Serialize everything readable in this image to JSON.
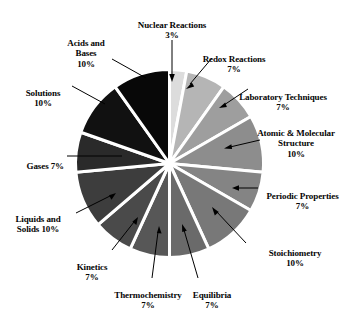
{
  "chart_data": {
    "type": "pie",
    "title": "",
    "subtitle": "",
    "xlabel": "",
    "ylabel": "",
    "legend_position": "none",
    "grid": false,
    "units": "percent",
    "total": 100,
    "start_angle_deg": 0,
    "direction": "clockwise",
    "categories": [
      "Nuclear Reactions",
      "Redox Reactions",
      "Laboratory Techniques",
      "Atomic & Molecular Structure",
      "Periodic Properties",
      "Stoichiometry",
      "Equilibria",
      "Thermochemistry",
      "Kinetics",
      "Liquids and Solids",
      "Gases",
      "Solutions",
      "Acids and Bases"
    ],
    "values": [
      3,
      7,
      7,
      10,
      7,
      10,
      7,
      7,
      7,
      10,
      7,
      10,
      10
    ],
    "colors": [
      "#dcdcdc",
      "#b5b5b5",
      "#9e9e9e",
      "#8d8d8d",
      "#848484",
      "#787878",
      "#6a6a6a",
      "#575757",
      "#4a4a4a",
      "#3d3d3d",
      "#2a2a2a",
      "#111111",
      "#080808"
    ],
    "slice_separator_color": "#ffffff",
    "slice_separator_width": 3,
    "data_labels": [
      {
        "label": "Nuclear Reactions",
        "value": 3,
        "text": "Nuclear Reactions",
        "pct": "3%"
      },
      {
        "label": "Redox Reactions",
        "value": 7,
        "text": "Redox Reactions",
        "pct": "7%"
      },
      {
        "label": "Laboratory Techniques",
        "value": 7,
        "text": "Laboratory Techniques",
        "pct": "7%"
      },
      {
        "label": "Atomic & Molecular Structure",
        "value": 10,
        "text": "Atomic & Molecular\nStructure",
        "pct": "10%"
      },
      {
        "label": "Periodic Properties",
        "value": 7,
        "text": "Periodic Properties",
        "pct": "7%"
      },
      {
        "label": "Stoichiometry",
        "value": 10,
        "text": "Stoichiometry",
        "pct": "10%"
      },
      {
        "label": "Equilibria",
        "value": 7,
        "text": "Equilibria",
        "pct": "7%"
      },
      {
        "label": "Thermochemistry",
        "value": 7,
        "text": "Thermochemistry",
        "pct": "7%"
      },
      {
        "label": "Kinetics",
        "value": 7,
        "text": "Kinetics",
        "pct": "7%"
      },
      {
        "label": "Liquids and Solids",
        "value": 10,
        "text": "Liquids and\nSolids 10%",
        "pct": ""
      },
      {
        "label": "Gases",
        "value": 7,
        "text": "Gases 7%",
        "pct": ""
      },
      {
        "label": "Solutions",
        "value": 10,
        "text": "Solutions",
        "pct": "10%"
      },
      {
        "label": "Acids and Bases",
        "value": 10,
        "text": "Acids and\nBases",
        "pct": "10%"
      }
    ]
  },
  "labels": {
    "nuclear_reactions": "Nuclear Reactions",
    "nuclear_reactions_pct": "3%",
    "redox_reactions": "Redox Reactions",
    "redox_reactions_pct": "7%",
    "laboratory_techniques": "Laboratory Techniques",
    "laboratory_techniques_pct": "7%",
    "atomic_molecular": "Atomic & Molecular\nStructure",
    "atomic_molecular_pct": "10%",
    "periodic_properties": "Periodic Properties",
    "periodic_properties_pct": "7%",
    "stoichiometry": "Stoichiometry",
    "stoichiometry_pct": "10%",
    "equilibria": "Equilibria",
    "equilibria_pct": "7%",
    "thermochemistry": "Thermochemistry",
    "thermochemistry_pct": "7%",
    "kinetics": "Kinetics",
    "kinetics_pct": "7%",
    "liquids_solids": "Liquids and\nSolids 10%",
    "gases": "Gases 7%",
    "solutions": "Solutions",
    "solutions_pct": "10%",
    "acids_bases": "Acids and\nBases",
    "acids_bases_pct": "10%"
  }
}
